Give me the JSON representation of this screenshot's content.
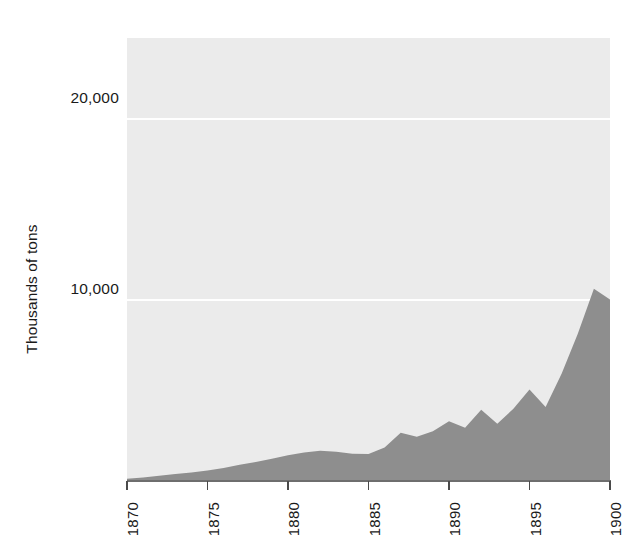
{
  "chart_data": {
    "type": "area",
    "title": "",
    "subtitle": "",
    "xlabel": "",
    "ylabel": "Thousands of tons",
    "xlim": [
      1870,
      1900
    ],
    "ylim": [
      0,
      24500
    ],
    "grid": true,
    "legend": null,
    "y_ticks": [
      "10,000",
      "20,000"
    ],
    "y_tick_values": [
      10000,
      20000
    ],
    "x_ticks": [
      "1870",
      "1875",
      "1880",
      "1885",
      "1890",
      "1895",
      "1900"
    ],
    "x_tick_values": [
      1870,
      1875,
      1880,
      1885,
      1890,
      1895,
      1900
    ],
    "x": [
      1870,
      1871,
      1872,
      1873,
      1874,
      1875,
      1876,
      1877,
      1878,
      1879,
      1880,
      1881,
      1882,
      1883,
      1884,
      1885,
      1886,
      1887,
      1888,
      1889,
      1890,
      1891,
      1892,
      1893,
      1894,
      1895,
      1896,
      1897,
      1898,
      1899,
      1900
    ],
    "values": [
      70,
      140,
      230,
      330,
      420,
      520,
      660,
      840,
      1000,
      1180,
      1370,
      1520,
      1620,
      1560,
      1460,
      1440,
      1800,
      2620,
      2400,
      2700,
      3250,
      2900,
      3900,
      3120,
      3950,
      5020,
      4050,
      5900,
      8100,
      10600,
      10000
    ],
    "series": [
      {
        "name": "Output",
        "unit": "thousands of tons",
        "color": "#8e8e8e",
        "values": [
          70,
          140,
          230,
          330,
          420,
          520,
          660,
          840,
          1000,
          1180,
          1370,
          1520,
          1620,
          1560,
          1460,
          1440,
          1800,
          2620,
          2400,
          2700,
          3250,
          2900,
          3900,
          3120,
          3950,
          5020,
          4050,
          5900,
          8100,
          10600,
          10000
        ]
      }
    ],
    "colors": {
      "area_fill": "#8e8e8e",
      "plot_background": "#ebebeb",
      "gridline": "#ffffff",
      "axis": "#6e6e6e",
      "text": "#1a1a1a"
    }
  },
  "axis": {
    "y_title": "Thousands of tons",
    "y_tick_20000": "20,000",
    "y_tick_10000": "10,000",
    "x_tick_1870": "1870",
    "x_tick_1875": "1875",
    "x_tick_1880": "1880",
    "x_tick_1885": "1885",
    "x_tick_1890": "1890",
    "x_tick_1895": "1895",
    "x_tick_1900": "1900"
  }
}
